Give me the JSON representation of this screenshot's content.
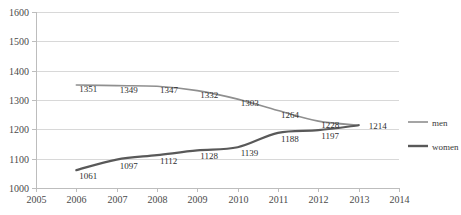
{
  "chart_data": {
    "type": "line",
    "title": "",
    "subtitle": "",
    "xlabel": "",
    "ylabel": "",
    "x": [
      2006,
      2007,
      2008,
      2009,
      2010,
      2011,
      2012,
      2013
    ],
    "categories": [
      "2006",
      "2007",
      "2008",
      "2009",
      "2010",
      "2011",
      "2012",
      "2013"
    ],
    "xlim": [
      2005,
      2014
    ],
    "ylim": [
      1000,
      1600
    ],
    "x_ticks": [
      "2005",
      "2006",
      "2007",
      "2008",
      "2009",
      "2010",
      "2011",
      "2012",
      "2013",
      "2014"
    ],
    "y_ticks": [
      "1000",
      "1100",
      "1200",
      "1300",
      "1400",
      "1500",
      "1600"
    ],
    "grid": true,
    "legend_position": "right",
    "series": [
      {
        "name": "men",
        "color": "#8f8f8f",
        "stroke_width": 1.6,
        "values": [
          1351,
          1349,
          1347,
          1332,
          1303,
          1264,
          1228,
          1214
        ],
        "labels": [
          "1351",
          "1349",
          "1347",
          "1332",
          "1303",
          "1264",
          "1228",
          "1214"
        ]
      },
      {
        "name": "women",
        "color": "#595959",
        "stroke_width": 2.2,
        "values": [
          1061,
          1097,
          1112,
          1128,
          1139,
          1188,
          1197,
          1214
        ],
        "labels": [
          "1061",
          "1097",
          "1112",
          "1128",
          "1139",
          "1188",
          "1197",
          "1214"
        ]
      }
    ],
    "legend": [
      {
        "label": "men",
        "color": "#8f8f8f",
        "stroke_width": 1.6
      },
      {
        "label": "women",
        "color": "#595959",
        "stroke_width": 2.4
      }
    ]
  },
  "plot": {
    "left": 36,
    "right": 399,
    "top": 12,
    "bottom": 188,
    "x_start_value": 2005,
    "x_end_value": 2014,
    "y_min": 1000,
    "y_max": 1600
  },
  "colors": {
    "background": "#ffffff",
    "gridline": "#d8d8d8",
    "axis": "#bdbdbd",
    "text": "#3a3a3a",
    "men": "#8f8f8f",
    "women": "#595959"
  },
  "legend_box": {
    "x": 408,
    "men_y": 122,
    "women_y": 146,
    "swatch_width": 20
  }
}
